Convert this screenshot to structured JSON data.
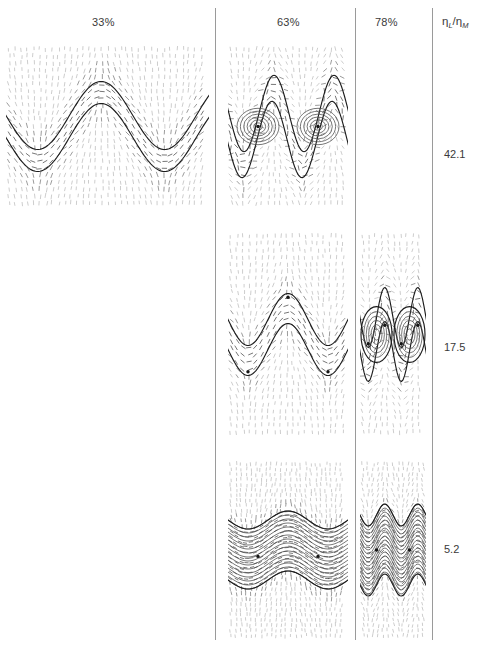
{
  "figure": {
    "type": "panel-matrix",
    "background": "#ffffff",
    "ink": "#2a2a2a",
    "width": 484,
    "height": 648,
    "columns": [
      {
        "id": "col-33",
        "label": "33%",
        "x": 110
      },
      {
        "id": "col-63",
        "label": "63%",
        "x": 295
      },
      {
        "id": "col-78",
        "label": "78%",
        "x": 392
      }
    ],
    "row_axis_label": {
      "symbol": "η",
      "sub_numerator": "L",
      "sub_denominator": "M",
      "text": "ηL/ηM"
    },
    "rows": [
      {
        "id": "row-42",
        "label": "42.1",
        "y": 155
      },
      {
        "id": "row-17",
        "label": "17.5",
        "y": 348
      },
      {
        "id": "row-5",
        "label": "5.2",
        "y": 550
      }
    ],
    "dividers": [
      {
        "id": "divider-1",
        "x": 215
      },
      {
        "id": "divider-2",
        "x": 355
      },
      {
        "id": "divider-3",
        "x": 432
      }
    ],
    "panels": [
      {
        "id": "panel-33-42",
        "column": "33%",
        "row": "42.1",
        "x": 6,
        "y": 45,
        "w": 203,
        "h": 163,
        "pattern": "single-sinusoidal-band",
        "waves": 1.6,
        "amplitude": 34,
        "band_thickness": 22,
        "defects": 0,
        "present": true
      },
      {
        "id": "panel-63-42",
        "column": "63%",
        "row": "42.1",
        "x": 228,
        "y": 45,
        "w": 120,
        "h": 163,
        "pattern": "folded-curled-band",
        "waves": 2,
        "amplitude": 40,
        "band_thickness": 26,
        "defects": 2,
        "present": true
      },
      {
        "id": "panel-78-42",
        "column": "78%",
        "row": "42.1",
        "x": 360,
        "y": 45,
        "w": 66,
        "h": 163,
        "pattern": "empty",
        "present": false
      },
      {
        "id": "panel-33-17",
        "column": "33%",
        "row": "17.5",
        "x": 6,
        "y": 232,
        "w": 203,
        "h": 205,
        "pattern": "empty",
        "present": false
      },
      {
        "id": "panel-63-17",
        "column": "63%",
        "row": "17.5",
        "x": 228,
        "y": 232,
        "w": 120,
        "h": 205,
        "pattern": "pinched-wavy-band",
        "waves": 1.5,
        "amplitude": 26,
        "band_thickness": 30,
        "defects": 3,
        "present": true
      },
      {
        "id": "panel-78-17",
        "column": "78%",
        "row": "17.5",
        "x": 360,
        "y": 232,
        "w": 66,
        "h": 205,
        "pattern": "closed-lens-loops",
        "waves": 2,
        "amplitude": 30,
        "band_thickness": 34,
        "defects": 4,
        "present": true
      },
      {
        "id": "panel-33-5",
        "column": "33%",
        "row": "5.2",
        "x": 6,
        "y": 460,
        "w": 203,
        "h": 180,
        "pattern": "empty",
        "present": false
      },
      {
        "id": "panel-63-5",
        "column": "63%",
        "row": "5.2",
        "x": 228,
        "y": 460,
        "w": 120,
        "h": 180,
        "pattern": "flat-striated-waves",
        "waves": 1.5,
        "amplitude": 9,
        "band_thickness": 60,
        "defects": 2,
        "present": true
      },
      {
        "id": "panel-78-5",
        "column": "78%",
        "row": "5.2",
        "x": 360,
        "y": 460,
        "w": 66,
        "h": 180,
        "pattern": "flat-striated-waves-narrow",
        "waves": 2,
        "amplitude": 11,
        "band_thickness": 70,
        "defects": 2,
        "present": true
      }
    ]
  }
}
